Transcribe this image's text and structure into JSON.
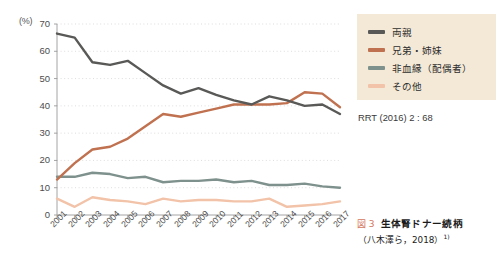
{
  "chart_data": {
    "type": "line",
    "title": "生体腎ドナー続柄",
    "xlabel": "",
    "ylabel": "(%)",
    "ylim": [
      0,
      70
    ],
    "yticks": [
      0,
      10,
      20,
      30,
      40,
      50,
      60,
      70
    ],
    "grid": true,
    "legend_position": "right",
    "categories": [
      "2001",
      "2002",
      "2003",
      "2004",
      "2005",
      "2006",
      "2007",
      "2008",
      "2009",
      "2010",
      "2011",
      "2012",
      "2013",
      "2014",
      "2015",
      "2016",
      "2017"
    ],
    "series": [
      {
        "name": "両親",
        "color": "#595a57",
        "values": [
          66.5,
          65.0,
          56.0,
          55.0,
          56.5,
          52.0,
          47.5,
          44.5,
          46.5,
          44.0,
          42.0,
          40.5,
          43.5,
          42.0,
          40.0,
          40.5,
          37.0
        ]
      },
      {
        "name": "兄弟・姉妹",
        "color": "#c0714f",
        "values": [
          13.0,
          19.0,
          24.0,
          25.0,
          28.0,
          32.5,
          37.0,
          36.0,
          37.5,
          39.0,
          40.5,
          40.5,
          40.5,
          41.0,
          45.0,
          44.5,
          39.5
        ]
      },
      {
        "name": "非血縁（配偶者）",
        "color": "#7e918c",
        "values": [
          14.0,
          14.0,
          15.5,
          15.0,
          13.5,
          14.0,
          12.0,
          12.5,
          12.5,
          13.0,
          12.0,
          12.5,
          11.0,
          11.0,
          11.5,
          10.5,
          10.0
        ]
      },
      {
        "name": "その他",
        "color": "#f2c3a8",
        "values": [
          6.0,
          3.0,
          6.5,
          5.5,
          5.0,
          4.0,
          6.0,
          5.0,
          5.5,
          5.5,
          5.0,
          5.0,
          6.0,
          3.0,
          3.5,
          4.0,
          5.0
        ]
      }
    ],
    "annotations": [
      "RRT (2016) 2 : 68"
    ]
  },
  "axis": {
    "unit_label": "(%)"
  },
  "legend": {
    "background": "#f4e9d6",
    "items": [
      {
        "label": "両親",
        "color": "#595a57"
      },
      {
        "label": "兄弟・姉妹",
        "color": "#c0714f"
      },
      {
        "label": "非血縁（配偶者）",
        "color": "#7e918c"
      },
      {
        "label": "その他",
        "color": "#f2c3a8"
      }
    ]
  },
  "source_note": "RRT (2016) 2 : 68",
  "caption": {
    "fig_number": "図 3",
    "title": "生体腎ドナー続柄",
    "subtitle": "（八木澤ら，2018）",
    "superscript": "1)",
    "fig_number_color": "#d4775c"
  }
}
